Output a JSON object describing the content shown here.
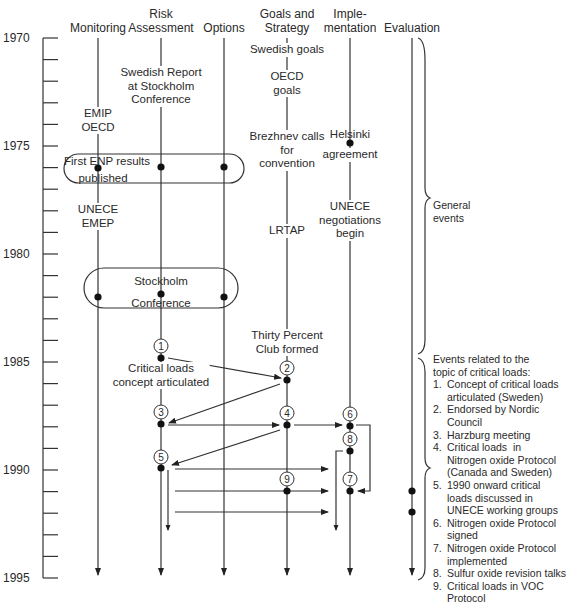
{
  "headers": {
    "monitoring": "Monitoring",
    "risk_assessment": "Risk\nAssessment",
    "options": "Options",
    "goals_strategy": "Goals and\nStrategy",
    "implementation": "Imple-\nmentation",
    "evaluation": "Evaluation"
  },
  "years": [
    "1970",
    "1975",
    "1980",
    "1985",
    "1990",
    "1995"
  ],
  "events": {
    "swedish_goals": "Swedish goals",
    "oecd_goals": "OECD\ngoals",
    "swedish_report": "Swedish Report\nat Stockholm\nConference",
    "emip_oecd": "EMIP\nOECD",
    "brezhnev": "Brezhnev calls\nfor\nconvention",
    "helsinki_top": "Helsinki",
    "helsinki_bottom": "agreement",
    "first_enp_1": "First ENP results",
    "first_enp_2": "published",
    "unece_emep": "UNECE\nEMEP",
    "unece_negotiations": "UNECE\nnegotiations\nbegin",
    "lrtap": "LRTAP",
    "stockholm_conf_1": "Stockholm",
    "stockholm_conf_2": "Conference",
    "thirty_percent": "Thirty Percent\nClub formed",
    "critical_loads": "Critical loads\nconcept articulated"
  },
  "markers": [
    "1",
    "2",
    "3",
    "4",
    "5",
    "6",
    "7",
    "8",
    "9"
  ],
  "side_labels": {
    "general_events": "General\nevents"
  },
  "legend": {
    "title": "Events related to the\ntopic of critical loads:",
    "items": [
      {
        "num": "1.",
        "text": "Concept of critical loads\narticulated (Sweden)"
      },
      {
        "num": "2.",
        "text": "Endorsed by Nordic\nCouncil"
      },
      {
        "num": "3.",
        "text": "Harzburg meeting"
      },
      {
        "num": "4.",
        "text": "Critical loads  in\nNitrogen oxide Protocol\n(Canada and Sweden)"
      },
      {
        "num": "5.",
        "text": "1990 onward critical\nloads discussed in\nUNECE working groups"
      },
      {
        "num": "6.",
        "text": "Nitrogen oxide Protocol\nsigned"
      },
      {
        "num": "7.",
        "text": "Nitrogen oxide Protocol\nimplemented"
      },
      {
        "num": "8.",
        "text": "Sulfur oxide revision talks"
      },
      {
        "num": "9.",
        "text": "Critical loads in VOC\nProtocol"
      }
    ]
  },
  "colors": {
    "line": "#333333",
    "text": "#2a2a2a",
    "background": "#ffffff"
  }
}
